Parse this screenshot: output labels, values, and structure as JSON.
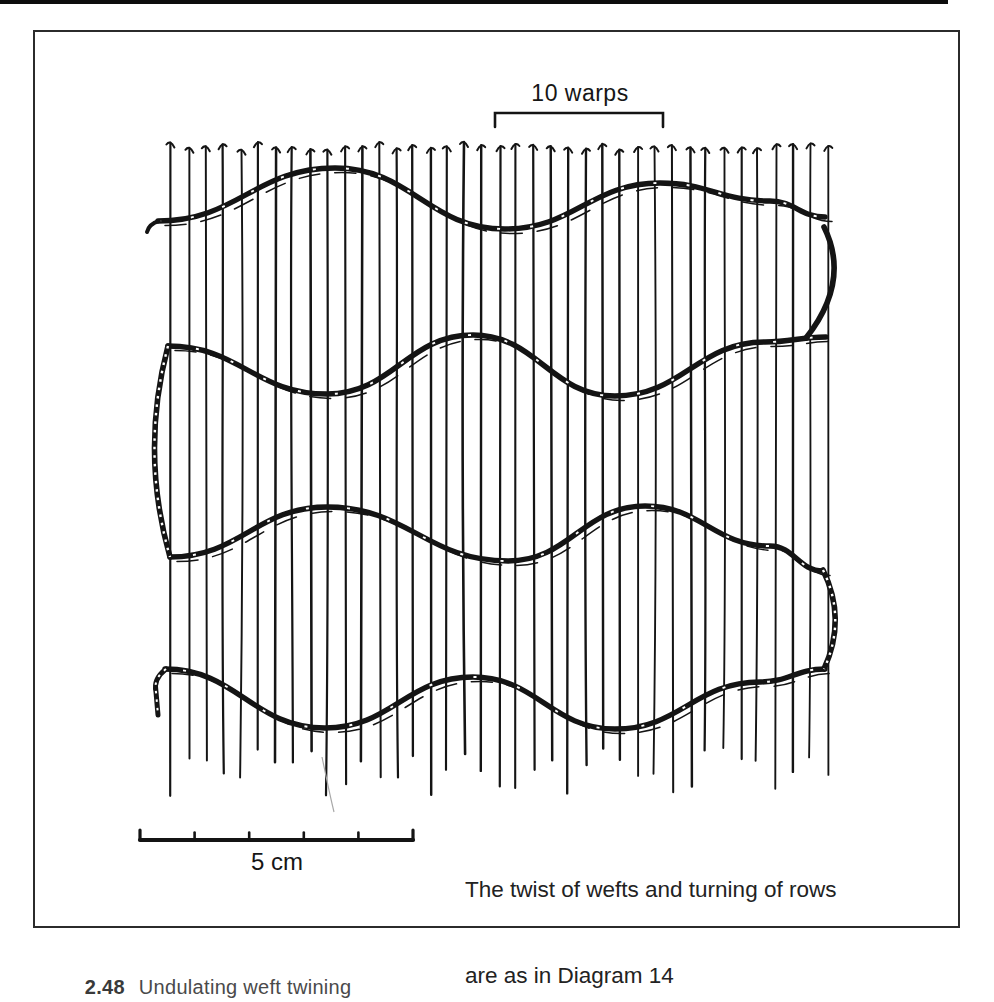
{
  "labels": {
    "bracket_label": "10 warps",
    "scale_label": "5 cm",
    "annotation_line1": "The twist of wefts and turning of rows",
    "annotation_line2": "are as in Diagram 14",
    "caption_number": "2.48",
    "caption_text": "Undulating weft twining"
  },
  "colors": {
    "ink": "#141414",
    "frame": "#2b2b2b",
    "paper": "#ffffff",
    "faint_mark": "#a8a8a8"
  },
  "drawing": {
    "warps": {
      "count": 39,
      "x_start": 172,
      "x_end": 827,
      "top_y": 142,
      "bottom_y_min": 745,
      "bottom_y_max": 797
    },
    "wefts": [
      {
        "points": [
          [
            158,
            221
          ],
          [
            335,
            168
          ],
          [
            505,
            229
          ],
          [
            660,
            183
          ],
          [
            770,
            201
          ],
          [
            825,
            217
          ]
        ]
      },
      {
        "points": [
          [
            168,
            346
          ],
          [
            327,
            394
          ],
          [
            473,
            335
          ],
          [
            615,
            396
          ],
          [
            765,
            342
          ],
          [
            826,
            337
          ]
        ]
      },
      {
        "points": [
          [
            170,
            557
          ],
          [
            327,
            507
          ],
          [
            508,
            561
          ],
          [
            645,
            506
          ],
          [
            770,
            546
          ],
          [
            823,
            571
          ]
        ]
      },
      {
        "points": [
          [
            165,
            669
          ],
          [
            325,
            728
          ],
          [
            473,
            677
          ],
          [
            615,
            729
          ],
          [
            760,
            682
          ],
          [
            825,
            669
          ]
        ]
      }
    ],
    "loops": [
      {
        "side": "right",
        "d": "M 824,227 Q 851,281 806,338",
        "hatched": false
      },
      {
        "side": "left",
        "d": "M 168,346 Q 140,452 170,557",
        "hatched": true
      },
      {
        "side": "right",
        "d": "M 823,570 Q 847,619 824,669",
        "hatched": true
      }
    ],
    "weft_tail": "M 166,669 Q 153,679 156,692 L 158,715",
    "weft_start_hook": "M 159,221 Q 149,224 147,232",
    "bracket": {
      "x1": 495,
      "x2": 663,
      "y": 113,
      "tick_len": 14
    },
    "scale_bar": {
      "x1": 140,
      "x2": 413,
      "y": 840,
      "segments": 5
    },
    "stray_mark": "M 322,757 C 326,776 330,796 334,812"
  }
}
